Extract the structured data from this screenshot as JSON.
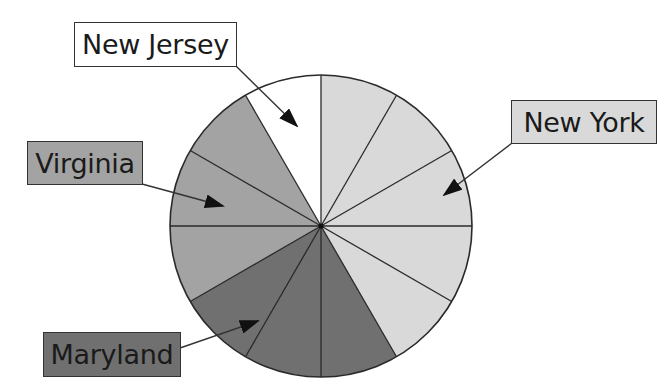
{
  "chart_data": {
    "type": "pie",
    "title": "",
    "title_note": "Title cropped at top edge; only descenders visible",
    "slice_unit_degrees": 30,
    "total_slices": 12,
    "start_angle_deg": 0,
    "direction": "clockwise",
    "series": [
      {
        "name": "New York",
        "slices": 5,
        "value": 5,
        "percent": 41.7,
        "color": "#d9d9d9"
      },
      {
        "name": "Maryland",
        "slices": 3,
        "value": 3,
        "percent": 25.0,
        "color": "#707070"
      },
      {
        "name": "Virginia",
        "slices": 3,
        "value": 3,
        "percent": 25.0,
        "color": "#a3a3a3"
      },
      {
        "name": "New Jersey",
        "slices": 1,
        "value": 1,
        "percent": 8.3,
        "color": "#ffffff"
      }
    ],
    "categories": [
      "New York",
      "Maryland",
      "Virginia",
      "New Jersey"
    ],
    "values": [
      5,
      3,
      3,
      1
    ],
    "legend_position": "callout labels with arrows"
  },
  "labels": {
    "new_jersey": "New Jersey",
    "new_york": "New York",
    "virginia": "Virginia",
    "maryland": "Maryland"
  },
  "colors": {
    "new_york": "#d9d9d9",
    "virginia": "#a3a3a3",
    "maryland": "#707070",
    "new_jersey": "#ffffff",
    "outline": "#2a2a2a"
  }
}
